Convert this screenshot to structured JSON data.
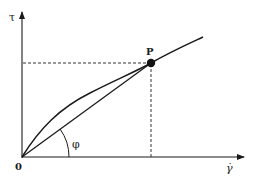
{
  "diagram": {
    "type": "rheology-shear-stress-curve",
    "axes": {
      "y_label": "τ",
      "x_label": "γ̇",
      "origin_label": "0"
    },
    "point": {
      "label": "P"
    },
    "angle": {
      "label": "φ"
    },
    "colors": {
      "line": "#1a1a1a",
      "dotted": "#333333",
      "background": "#ffffff"
    }
  }
}
